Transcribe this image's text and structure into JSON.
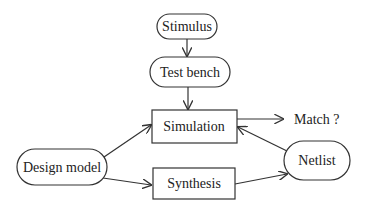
{
  "diagram": {
    "nodes": {
      "stimulus": {
        "label": "Stimulus",
        "shape": "rounded"
      },
      "test_bench": {
        "label": "Test bench",
        "shape": "rounded"
      },
      "simulation": {
        "label": "Simulation",
        "shape": "rectangle"
      },
      "design_model": {
        "label": "Design model",
        "shape": "rounded"
      },
      "synthesis": {
        "label": "Synthesis",
        "shape": "rectangle"
      },
      "netlist": {
        "label": "Netlist",
        "shape": "rounded"
      }
    },
    "output_label": "Match ?",
    "edges": [
      {
        "from": "Stimulus",
        "to": "Test bench"
      },
      {
        "from": "Test bench",
        "to": "Simulation"
      },
      {
        "from": "Design model",
        "to": "Simulation"
      },
      {
        "from": "Design model",
        "to": "Synthesis"
      },
      {
        "from": "Synthesis",
        "to": "Netlist"
      },
      {
        "from": "Netlist",
        "to": "Simulation"
      },
      {
        "from": "Simulation",
        "to": "Match ?"
      }
    ],
    "colors": {
      "stroke": "#333333",
      "text": "#222222",
      "background": "#ffffff"
    }
  }
}
